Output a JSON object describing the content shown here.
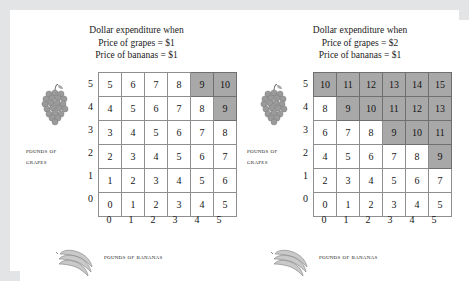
{
  "figure": {
    "frame_color": "#e3e4e6",
    "background": "#ffffff",
    "shade_color": "#a8a8a8",
    "grid_line_color": "#8e8e8e"
  },
  "panels": [
    {
      "id": "left",
      "title_line1": "Dollar expenditure when",
      "title_line2": "Price of grapes = $1",
      "title_line3": "Price of bananas = $1",
      "y_axis_caption_line1": "Pounds of",
      "y_axis_caption_line2": "grapes",
      "x_axis_caption": "Pounds of bananas",
      "y_tick_labels": [
        "5",
        "4",
        "3",
        "2",
        "1",
        "0"
      ],
      "x_tick_labels": [
        "0",
        "1",
        "2",
        "3",
        "4",
        "5"
      ],
      "grapes_icon": "grapes-icon",
      "bananas_icon": "bananas-icon"
    },
    {
      "id": "right",
      "title_line1": "Dollar expenditure when",
      "title_line2": "Price of grapes = $2",
      "title_line3": "Price of bananas = $1",
      "y_axis_caption_line1": "Pounds of",
      "y_axis_caption_line2": "grapes",
      "x_axis_caption": "Pounds of bananas",
      "y_tick_labels": [
        "5",
        "4",
        "3",
        "2",
        "1",
        "0"
      ],
      "x_tick_labels": [
        "0",
        "1",
        "2",
        "3",
        "4",
        "5"
      ],
      "grapes_icon": "grapes-icon",
      "bananas_icon": "bananas-icon"
    }
  ],
  "chart_data": [
    {
      "type": "table",
      "title": "Dollar expenditure when Price of grapes = $1, Price of bananas = $1",
      "xlabel": "Pounds of bananas",
      "ylabel": "Pounds of grapes",
      "x": [
        0,
        1,
        2,
        3,
        4,
        5
      ],
      "y_rows_top_to_bottom": [
        5,
        4,
        3,
        2,
        1,
        0
      ],
      "formula": "1*grapes + 1*bananas",
      "rows": [
        {
          "grapes": 5,
          "values": [
            5,
            6,
            7,
            8,
            9,
            10
          ],
          "shaded": [
            false,
            false,
            false,
            false,
            true,
            true
          ]
        },
        {
          "grapes": 4,
          "values": [
            4,
            5,
            6,
            7,
            8,
            9
          ],
          "shaded": [
            false,
            false,
            false,
            false,
            false,
            true
          ]
        },
        {
          "grapes": 3,
          "values": [
            3,
            4,
            5,
            6,
            7,
            8
          ],
          "shaded": [
            false,
            false,
            false,
            false,
            false,
            false
          ]
        },
        {
          "grapes": 2,
          "values": [
            2,
            3,
            4,
            5,
            6,
            7
          ],
          "shaded": [
            false,
            false,
            false,
            false,
            false,
            false
          ]
        },
        {
          "grapes": 1,
          "values": [
            1,
            2,
            3,
            4,
            5,
            6
          ],
          "shaded": [
            false,
            false,
            false,
            false,
            false,
            false
          ]
        },
        {
          "grapes": 0,
          "values": [
            0,
            1,
            2,
            3,
            4,
            5
          ],
          "shaded": [
            false,
            false,
            false,
            false,
            false,
            false
          ]
        }
      ],
      "shading_rule": "cells with expenditure greater than or equal to 9 are shaded"
    },
    {
      "type": "table",
      "title": "Dollar expenditure when Price of grapes = $2, Price of bananas = $1",
      "xlabel": "Pounds of bananas",
      "ylabel": "Pounds of grapes",
      "x": [
        0,
        1,
        2,
        3,
        4,
        5
      ],
      "y_rows_top_to_bottom": [
        5,
        4,
        3,
        2,
        1,
        0
      ],
      "formula": "2*grapes + 1*bananas",
      "rows": [
        {
          "grapes": 5,
          "values": [
            10,
            11,
            12,
            13,
            14,
            15
          ],
          "shaded": [
            true,
            true,
            true,
            true,
            true,
            true
          ]
        },
        {
          "grapes": 4,
          "values": [
            8,
            9,
            10,
            11,
            12,
            13
          ],
          "shaded": [
            false,
            true,
            true,
            true,
            true,
            true
          ]
        },
        {
          "grapes": 3,
          "values": [
            6,
            7,
            8,
            9,
            10,
            11
          ],
          "shaded": [
            false,
            false,
            false,
            true,
            true,
            true
          ]
        },
        {
          "grapes": 2,
          "values": [
            4,
            5,
            6,
            7,
            8,
            9
          ],
          "shaded": [
            false,
            false,
            false,
            false,
            false,
            true
          ]
        },
        {
          "grapes": 1,
          "values": [
            2,
            3,
            4,
            5,
            6,
            7
          ],
          "shaded": [
            false,
            false,
            false,
            false,
            false,
            false
          ]
        },
        {
          "grapes": 0,
          "values": [
            0,
            1,
            2,
            3,
            4,
            5
          ],
          "shaded": [
            false,
            false,
            false,
            false,
            false,
            false
          ]
        }
      ],
      "shading_rule": "cells with expenditure greater than or equal to 9 are shaded"
    }
  ]
}
